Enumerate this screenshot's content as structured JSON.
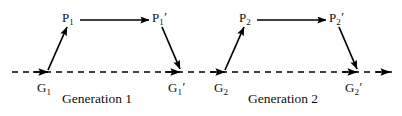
{
  "figure": {
    "background_color": "#ffffff",
    "stroke_color": "#000000",
    "text_color": "#111111",
    "width": 402,
    "height": 116
  },
  "baseline": {
    "name": "genetic-baseline",
    "style": "dashed",
    "y": 72,
    "x_start": 12,
    "x_end": 392,
    "dash_pattern": "6,5"
  },
  "generations": [
    {
      "caption": "Generation 1",
      "caption_x": 62,
      "caption_y": 92,
      "nodes": {
        "g": {
          "base": "G",
          "sub": "1",
          "prime": "",
          "x": 48,
          "y": 72,
          "label_x": 37,
          "label_y": 80
        },
        "p": {
          "base": "P",
          "sub": "1",
          "prime": "",
          "x": 68,
          "y": 25,
          "label_x": 62,
          "label_y": 10
        },
        "p_prime": {
          "base": "P",
          "sub": "1",
          "prime": "′",
          "x": 160,
          "y": 25,
          "label_x": 152,
          "label_y": 10
        },
        "g_prime": {
          "base": "G",
          "sub": "1",
          "prime": "′",
          "x": 180,
          "y": 72,
          "label_x": 168,
          "label_y": 80
        }
      },
      "arrows": {
        "g_to_p": {
          "x1": 48,
          "y1": 70,
          "x2": 67,
          "y2": 27
        },
        "p_to_p_prime": {
          "x1": 80,
          "y1": 20,
          "x2": 149,
          "y2": 20
        },
        "p_prime_to_g_prime": {
          "x1": 162,
          "y1": 27,
          "x2": 180,
          "y2": 69
        }
      }
    },
    {
      "caption": "Generation 2",
      "caption_x": 248,
      "caption_y": 92,
      "nodes": {
        "g": {
          "base": "G",
          "sub": "2",
          "prime": "",
          "x": 225,
          "y": 72,
          "label_x": 214,
          "label_y": 80
        },
        "p": {
          "base": "P",
          "sub": "2",
          "prime": "",
          "x": 245,
          "y": 25,
          "label_x": 239,
          "label_y": 10
        },
        "p_prime": {
          "base": "P",
          "sub": "2",
          "prime": "′",
          "x": 337,
          "y": 25,
          "label_x": 329,
          "label_y": 10
        },
        "g_prime": {
          "base": "G",
          "sub": "2",
          "prime": "′",
          "x": 357,
          "y": 72,
          "label_x": 345,
          "label_y": 80
        }
      },
      "arrows": {
        "g_to_p": {
          "x1": 225,
          "y1": 70,
          "x2": 244,
          "y2": 27
        },
        "p_to_p_prime": {
          "x1": 257,
          "y1": 20,
          "x2": 326,
          "y2": 20
        },
        "p_prime_to_g_prime": {
          "x1": 339,
          "y1": 27,
          "x2": 357,
          "y2": 69
        }
      }
    }
  ],
  "baseline_arrowheads": [
    {
      "name": "arrowhead-to-g1",
      "x": 48,
      "y": 72
    },
    {
      "name": "arrowhead-to-g1-prime",
      "x": 180,
      "y": 72
    },
    {
      "name": "arrowhead-to-g2",
      "x": 225,
      "y": 72
    },
    {
      "name": "arrowhead-to-g2-prime",
      "x": 357,
      "y": 72
    },
    {
      "name": "arrowhead-baseline-end",
      "x": 390,
      "y": 72
    }
  ]
}
